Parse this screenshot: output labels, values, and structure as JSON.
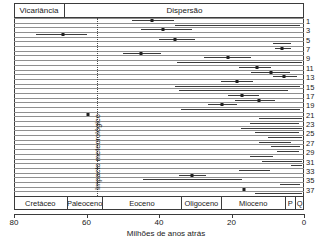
{
  "header": {
    "vicariance_label": "Vicariância",
    "dispersal_label": "Dispersão"
  },
  "annotation": {
    "impact_label": "Impacto meteorológico",
    "impact_age_ma": 57
  },
  "axis": {
    "title": "Milhões de anos atrás",
    "ticks": [
      80,
      60,
      40,
      20,
      0
    ],
    "min_ma": 0,
    "max_ma": 80,
    "direction": "reversed"
  },
  "epochs": [
    {
      "name": "Cretáceo",
      "start_ma": 80,
      "end_ma": 65.5
    },
    {
      "name": "Paleoceno",
      "start_ma": 65.5,
      "end_ma": 55.8
    },
    {
      "name": "Eoceno",
      "start_ma": 55.8,
      "end_ma": 33.9
    },
    {
      "name": "Oligoceno",
      "start_ma": 33.9,
      "end_ma": 23.0
    },
    {
      "name": "Mioceno",
      "start_ma": 23.0,
      "end_ma": 5.3
    },
    {
      "name": "P",
      "start_ma": 5.3,
      "end_ma": 2.6
    },
    {
      "name": "Q",
      "start_ma": 2.6,
      "end_ma": 0
    }
  ],
  "row_numbers": [
    1,
    3,
    5,
    7,
    9,
    11,
    13,
    15,
    17,
    19,
    21,
    23,
    25,
    27,
    29,
    31,
    33,
    35,
    37
  ],
  "chart_data": {
    "type": "scatter",
    "title": "",
    "xlabel": "Milhões de anos atrás",
    "ylabel": "",
    "xlim": [
      80,
      0
    ],
    "grid": false,
    "legend": "none",
    "orientation": "horizontal",
    "marker": "point-estimate-with-range",
    "series": [
      {
        "name": "estimativa 1",
        "estimate": 42.0,
        "low": 47.5,
        "high": 36.0
      },
      {
        "name": "estimativa 2",
        "estimate": null,
        "low": 35.5,
        "high": 1.0
      },
      {
        "name": "estimativa 3",
        "estimate": 39.0,
        "low": 45.0,
        "high": 31.0
      },
      {
        "name": "estimativa 4",
        "estimate": 66.5,
        "low": 74.0,
        "high": 60.0
      },
      {
        "name": "estimativa 5",
        "estimate": 35.5,
        "low": 40.0,
        "high": 30.0
      },
      {
        "name": "estimativa 6",
        "estimate": null,
        "low": 8.5,
        "high": 3.5
      },
      {
        "name": "estimativa 7",
        "estimate": 6.0,
        "low": 8.0,
        "high": 3.5
      },
      {
        "name": "estimativa 8",
        "estimate": 45.0,
        "low": 50.0,
        "high": 39.5
      },
      {
        "name": "estimativa 9",
        "estimate": 21.0,
        "low": 27.5,
        "high": 14.5
      },
      {
        "name": "estimativa 10",
        "estimate": null,
        "low": 35.0,
        "high": 0.5
      },
      {
        "name": "estimativa 11",
        "estimate": 13.0,
        "low": 18.0,
        "high": 9.0
      },
      {
        "name": "estimativa 12",
        "estimate": 9.0,
        "low": 14.5,
        "high": 4.0
      },
      {
        "name": "estimativa 13",
        "estimate": 5.5,
        "low": 8.5,
        "high": 2.0
      },
      {
        "name": "estimativa 14",
        "estimate": 18.5,
        "low": 23.0,
        "high": 14.0
      },
      {
        "name": "estimativa 15",
        "estimate": null,
        "low": 35.5,
        "high": 1.0
      },
      {
        "name": "estimativa 16",
        "estimate": null,
        "low": 34.5,
        "high": 4.5
      },
      {
        "name": "estimativa 17",
        "estimate": 17.0,
        "low": 21.0,
        "high": 12.5
      },
      {
        "name": "estimativa 18",
        "estimate": 12.5,
        "low": 19.0,
        "high": 8.0
      },
      {
        "name": "estimativa 19",
        "estimate": 22.5,
        "low": 26.5,
        "high": 18.5
      },
      {
        "name": "estimativa 20",
        "estimate": null,
        "low": 34.0,
        "high": 1.0
      },
      {
        "name": "estimativa 21",
        "estimate": 59.5,
        "low": 59.5,
        "high": 59.5
      },
      {
        "name": "estimativa 22",
        "estimate": null,
        "low": 12.5,
        "high": 0.5
      },
      {
        "name": "estimativa 23",
        "estimate": null,
        "low": 15.0,
        "high": 1.5
      },
      {
        "name": "estimativa 24",
        "estimate": null,
        "low": 17.5,
        "high": 0.5
      },
      {
        "name": "estimativa 25",
        "estimate": null,
        "low": 13.5,
        "high": 1.5
      },
      {
        "name": "estimativa 26",
        "estimate": null,
        "low": 10.0,
        "high": 0.5
      },
      {
        "name": "estimativa 27",
        "estimate": null,
        "low": 12.5,
        "high": 3.5
      },
      {
        "name": "estimativa 28",
        "estimate": null,
        "low": 9.0,
        "high": 1.0
      },
      {
        "name": "estimativa 29",
        "estimate": null,
        "low": 7.5,
        "high": 1.5
      },
      {
        "name": "estimativa 30",
        "estimate": null,
        "low": 15.0,
        "high": 8.5
      },
      {
        "name": "estimativa 31",
        "estimate": null,
        "low": 11.5,
        "high": 0.5
      },
      {
        "name": "estimativa 32",
        "estimate": null,
        "low": 3.5,
        "high": 0.5
      },
      {
        "name": "estimativa 33",
        "estimate": null,
        "low": 18.0,
        "high": 9.5
      },
      {
        "name": "estimativa 34",
        "estimate": 31.0,
        "low": 34.5,
        "high": 27.0
      },
      {
        "name": "estimativa 35",
        "estimate": null,
        "low": 44.5,
        "high": 17.0
      },
      {
        "name": "estimativa 36",
        "estimate": null,
        "low": 6.5,
        "high": 1.0
      },
      {
        "name": "estimativa 37",
        "estimate": 16.5,
        "low": 16.5,
        "high": 16.5
      },
      {
        "name": "estimativa 38",
        "estimate": null,
        "low": 13.5,
        "high": 0.5
      }
    ]
  }
}
